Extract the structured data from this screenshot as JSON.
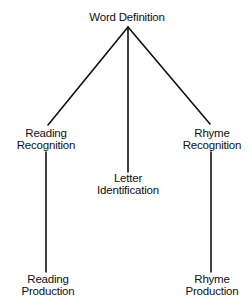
{
  "diagram": {
    "type": "tree",
    "line_color": "#111111",
    "nodes": {
      "root": {
        "id": "word-definition",
        "lines": [
          "Word Definition"
        ]
      },
      "left": {
        "id": "reading-recognition",
        "lines": [
          "Reading",
          "Recognition"
        ]
      },
      "center": {
        "id": "letter-identification",
        "lines": [
          "Letter",
          "Identification"
        ]
      },
      "right": {
        "id": "rhyme-recognition",
        "lines": [
          "Rhyme",
          "Recognition"
        ]
      },
      "left_child": {
        "id": "reading-production",
        "lines": [
          "Reading",
          "Production"
        ]
      },
      "right_child": {
        "id": "rhyme-production",
        "lines": [
          "Rhyme",
          "Production"
        ]
      }
    },
    "edges": [
      {
        "from": "Word Definition",
        "to": "Reading Recognition"
      },
      {
        "from": "Word Definition",
        "to": "Letter Identification"
      },
      {
        "from": "Word Definition",
        "to": "Rhyme Recognition"
      },
      {
        "from": "Reading Recognition",
        "to": "Reading Production"
      },
      {
        "from": "Rhyme Recognition",
        "to": "Rhyme Production"
      }
    ]
  }
}
